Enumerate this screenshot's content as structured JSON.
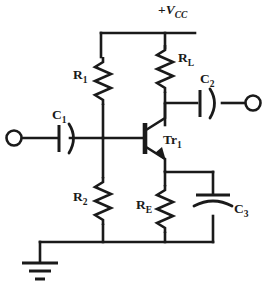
{
  "diagram": {
    "supply": {
      "prefix": "+",
      "symbol": "V",
      "subscript": "CC",
      "full": "+VCC"
    },
    "components": [
      {
        "id": "R1",
        "label": "R",
        "subscript": "1",
        "type": "resistor",
        "orientation": "vertical"
      },
      {
        "id": "R2",
        "label": "R",
        "subscript": "2",
        "type": "resistor",
        "orientation": "vertical"
      },
      {
        "id": "RL",
        "label": "R",
        "subscript": "L",
        "type": "resistor",
        "orientation": "vertical"
      },
      {
        "id": "RE",
        "label": "R",
        "subscript": "E",
        "type": "resistor",
        "orientation": "vertical"
      },
      {
        "id": "C1",
        "label": "C",
        "subscript": "1",
        "type": "capacitor",
        "orientation": "horizontal"
      },
      {
        "id": "C2",
        "label": "C",
        "subscript": "2",
        "type": "capacitor",
        "orientation": "horizontal"
      },
      {
        "id": "C3",
        "label": "C",
        "subscript": "3",
        "type": "capacitor",
        "orientation": "vertical"
      },
      {
        "id": "Tr1",
        "label": "Tr",
        "subscript": "1",
        "type": "transistor-npn",
        "orientation": "vertical"
      }
    ],
    "terminals": [
      {
        "id": "input",
        "position": "left"
      },
      {
        "id": "output",
        "position": "right"
      }
    ],
    "ground": {
      "id": "gnd",
      "type": "earth",
      "bars": 3
    },
    "colors": {
      "ink": "#1a1a1a",
      "background": "#ffffff"
    }
  }
}
